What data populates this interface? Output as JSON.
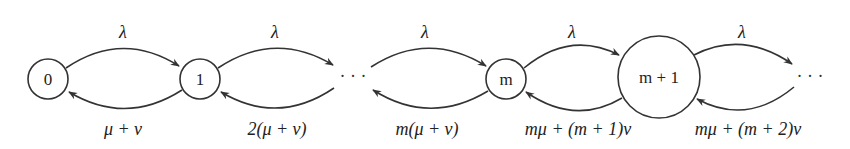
{
  "diagram": {
    "type": "state-transition",
    "nodes": [
      {
        "id": "n0",
        "label": "0"
      },
      {
        "id": "n1",
        "label": "1"
      },
      {
        "id": "dots1",
        "label": "· · ·"
      },
      {
        "id": "nm",
        "label": "m"
      },
      {
        "id": "nm1",
        "label": "m + 1"
      },
      {
        "id": "dots2",
        "label": "· · ·"
      }
    ],
    "forward_rates": [
      {
        "from": "0",
        "to": "1",
        "label": "λ"
      },
      {
        "from": "1",
        "to": "…",
        "label": "λ"
      },
      {
        "from": "…",
        "to": "m",
        "label": "λ"
      },
      {
        "from": "m",
        "to": "m+1",
        "label": "λ"
      },
      {
        "from": "m+1",
        "to": "…",
        "label": "λ"
      }
    ],
    "backward_rates": [
      {
        "from": "1",
        "to": "0",
        "label": "μ + ν"
      },
      {
        "from": "…",
        "to": "1",
        "label": "2(μ + ν)"
      },
      {
        "from": "m",
        "to": "…",
        "label": "m(μ + ν)"
      },
      {
        "from": "m+1",
        "to": "m",
        "label": "mμ + (m + 1)ν"
      },
      {
        "from": "…",
        "to": "m+1",
        "label": "mμ + (m + 2)ν"
      }
    ]
  }
}
